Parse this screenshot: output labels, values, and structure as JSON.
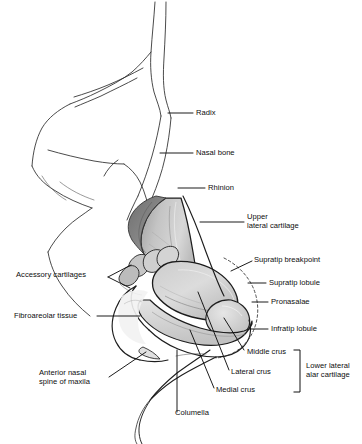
{
  "figure": {
    "background_color": "#ffffff",
    "line_color": "#1a1a1a",
    "shade_light": "#d2d2d2",
    "shade_mid": "#b4b4b4",
    "shade_dark": "#7c7c7c",
    "text_color": "#0d0d0d"
  },
  "labels": {
    "radix": "Radix",
    "nasal_bone": "Nasal bone",
    "rhinion": "Rhinion",
    "upper_lateral_cartilage_line1": "Upper",
    "upper_lateral_cartilage_line2": "lateral cartilage",
    "supratip_breakpoint": "Supratip breakpoint",
    "supratip_lobule": "Supratip lobule",
    "pronasalae": "Pronasalae",
    "infratip_lobule": "Infratip lobule",
    "middle_crus": "Middle crus",
    "lateral_crus": "Lateral crus",
    "medial_crus": "Medial crus",
    "lower_lateral_alar_cartilage_line1": "Lower lateral",
    "lower_lateral_alar_cartilage_line2": "alar cartilage",
    "accessory_cartilages": "Accessory cartilages",
    "fibroareolar_tissue": "Fibroareolar tissue",
    "anterior_nasal_spine_line1": "Anterior nasal",
    "anterior_nasal_spine_line2": "spine of maxila",
    "columella": "Columella"
  }
}
